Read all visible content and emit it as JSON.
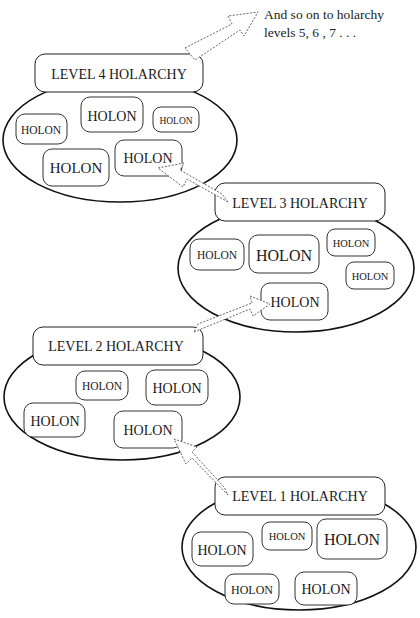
{
  "note": {
    "line1": "And so on to holarchy",
    "line2": "levels 5, 6 , 7 . . ."
  },
  "levels": [
    {
      "id": "level4",
      "label": "LEVEL 4 HOLARCHY",
      "holons": [
        "HOLON",
        "HOLON",
        "HOLON",
        "HOLON",
        "HOLON"
      ]
    },
    {
      "id": "level3",
      "label": "LEVEL 3 HOLARCHY",
      "holons": [
        "HOLON",
        "HOLON",
        "HOLON",
        "HOLON",
        "HOLON"
      ]
    },
    {
      "id": "level2",
      "label": "LEVEL 2 HOLARCHY",
      "holons": [
        "HOLON",
        "HOLON",
        "HOLON",
        "HOLON"
      ]
    },
    {
      "id": "level1",
      "label": "LEVEL 1 HOLARCHY",
      "holons": [
        "HOLON",
        "HOLON",
        "HOLON",
        "HOLON",
        "HOLON"
      ]
    }
  ],
  "colors": {
    "stroke": "#111111",
    "background": "#ffffff",
    "arrow_stroke": "#555555"
  }
}
